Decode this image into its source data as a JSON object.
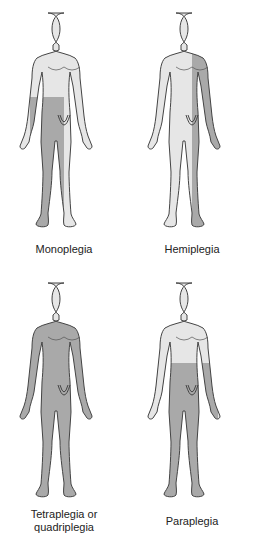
{
  "colors": {
    "skin": "#e6e6e6",
    "affected": "#a9a9a9",
    "outline": "#444444"
  },
  "figures": [
    {
      "id": "monoplegia",
      "label": "Monoplegia",
      "region": "one-leg"
    },
    {
      "id": "hemiplegia",
      "label": "Hemiplegia",
      "region": "one-side"
    },
    {
      "id": "tetraplegia",
      "label": "Tetraplegia or quadriplegia",
      "label_line1": "Tetraplegia or",
      "label_line2": "quadriplegia",
      "region": "all-limbs"
    },
    {
      "id": "paraplegia",
      "label": "Paraplegia",
      "region": "lower-body"
    }
  ]
}
